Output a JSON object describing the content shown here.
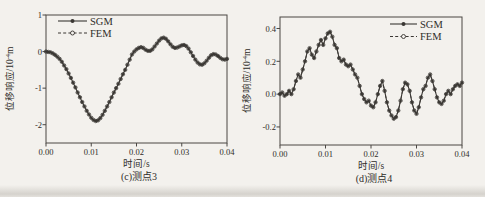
{
  "figure": {
    "background_color": "#f3f1ed",
    "curve_color": "#3a3733"
  },
  "chart_data": [
    {
      "type": "line",
      "caption": "(c)测点3",
      "xlabel": "时间/s",
      "ylabel_prefix": "位移响应/10",
      "ylabel_exp": "-4",
      "ylabel_unit": "m",
      "legend_position": "top-left",
      "grid": false,
      "color": "#3a3733",
      "xlim": [
        0,
        0.04
      ],
      "ylim": [
        -2.5,
        1.0
      ],
      "xticks": [
        0,
        0.01,
        0.02,
        0.03,
        0.04
      ],
      "xtick_labels": [
        "0.00",
        "0.01",
        "0.02",
        "0.03",
        "0.04"
      ],
      "yticks": [
        1,
        0,
        -1,
        -2
      ],
      "ytick_labels": [
        "1",
        "0",
        "-1",
        "-2"
      ],
      "x": [
        0,
        0.0005,
        0.001,
        0.0015,
        0.002,
        0.0025,
        0.003,
        0.0035,
        0.004,
        0.0045,
        0.005,
        0.0055,
        0.006,
        0.0065,
        0.007,
        0.0075,
        0.008,
        0.0085,
        0.009,
        0.0095,
        0.01,
        0.0105,
        0.011,
        0.0115,
        0.012,
        0.0125,
        0.013,
        0.0135,
        0.014,
        0.0145,
        0.015,
        0.0155,
        0.016,
        0.0165,
        0.017,
        0.0175,
        0.018,
        0.0185,
        0.019,
        0.0195,
        0.02,
        0.0205,
        0.021,
        0.0215,
        0.022,
        0.0225,
        0.023,
        0.0235,
        0.024,
        0.0245,
        0.025,
        0.0255,
        0.026,
        0.0265,
        0.027,
        0.0275,
        0.028,
        0.0285,
        0.029,
        0.0295,
        0.03,
        0.0305,
        0.031,
        0.0315,
        0.032,
        0.0325,
        0.033,
        0.0335,
        0.034,
        0.0345,
        0.035,
        0.0355,
        0.036,
        0.0365,
        0.037,
        0.0375,
        0.038,
        0.0385,
        0.039,
        0.0395,
        0.04
      ],
      "series": [
        {
          "name": "SGM",
          "line": "solid",
          "marker": "filled-circle",
          "y": [
            0,
            -0.01,
            -0.02,
            -0.05,
            -0.09,
            -0.14,
            -0.2,
            -0.28,
            -0.38,
            -0.48,
            -0.6,
            -0.72,
            -0.85,
            -0.98,
            -1.12,
            -1.25,
            -1.38,
            -1.5,
            -1.62,
            -1.72,
            -1.81,
            -1.87,
            -1.9,
            -1.88,
            -1.82,
            -1.73,
            -1.62,
            -1.5,
            -1.38,
            -1.25,
            -1.12,
            -1,
            -0.88,
            -0.75,
            -0.62,
            -0.5,
            -0.36,
            -0.22,
            -0.08,
            0,
            0.06,
            0.1,
            0.12,
            0.1,
            0.05,
            0.02,
            0.02,
            0.06,
            0.14,
            0.22,
            0.3,
            0.36,
            0.38,
            0.35,
            0.28,
            0.2,
            0.13,
            0.1,
            0.11,
            0.14,
            0.17,
            0.18,
            0.15,
            0.08,
            -0.02,
            -0.12,
            -0.22,
            -0.3,
            -0.35,
            -0.36,
            -0.32,
            -0.25,
            -0.17,
            -0.1,
            -0.07,
            -0.08,
            -0.12,
            -0.17,
            -0.21,
            -0.22,
            -0.2
          ]
        },
        {
          "name": "FEM",
          "line": "dashed",
          "marker": "open-circle",
          "y": [
            0,
            -0.01,
            -0.02,
            -0.05,
            -0.09,
            -0.14,
            -0.2,
            -0.28,
            -0.38,
            -0.48,
            -0.6,
            -0.72,
            -0.85,
            -0.98,
            -1.12,
            -1.25,
            -1.38,
            -1.5,
            -1.62,
            -1.72,
            -1.81,
            -1.87,
            -1.9,
            -1.88,
            -1.82,
            -1.73,
            -1.62,
            -1.5,
            -1.38,
            -1.25,
            -1.12,
            -1,
            -0.88,
            -0.75,
            -0.62,
            -0.5,
            -0.36,
            -0.22,
            -0.08,
            0,
            0.06,
            0.1,
            0.12,
            0.1,
            0.05,
            0.02,
            0.02,
            0.06,
            0.14,
            0.22,
            0.3,
            0.36,
            0.38,
            0.35,
            0.28,
            0.2,
            0.13,
            0.1,
            0.11,
            0.14,
            0.17,
            0.18,
            0.15,
            0.08,
            -0.02,
            -0.12,
            -0.22,
            -0.3,
            -0.35,
            -0.36,
            -0.32,
            -0.25,
            -0.17,
            -0.1,
            -0.07,
            -0.08,
            -0.12,
            -0.17,
            -0.21,
            -0.22,
            -0.2
          ]
        }
      ]
    },
    {
      "type": "line",
      "caption": "(d)测点4",
      "xlabel": "时间/s",
      "ylabel_prefix": "位移响应/10",
      "ylabel_exp": "-4",
      "ylabel_unit": "m",
      "legend_position": "top-right",
      "grid": false,
      "color": "#3a3733",
      "xlim": [
        0,
        0.04
      ],
      "ylim": [
        -0.31,
        0.47
      ],
      "xticks": [
        0,
        0.01,
        0.02,
        0.03,
        0.04
      ],
      "xtick_labels": [
        "0.00",
        "0.01",
        "0.02",
        "0.03",
        "0.04"
      ],
      "yticks": [
        0.4,
        0.2,
        0.0,
        -0.2
      ],
      "ytick_labels": [
        "0.4",
        "0.2",
        "0.0",
        "-0.2"
      ],
      "x": [
        0,
        0.0005,
        0.001,
        0.0015,
        0.002,
        0.0025,
        0.003,
        0.0035,
        0.004,
        0.0045,
        0.005,
        0.0055,
        0.006,
        0.0065,
        0.007,
        0.0075,
        0.008,
        0.0085,
        0.009,
        0.0095,
        0.01,
        0.0105,
        0.011,
        0.0115,
        0.012,
        0.0125,
        0.013,
        0.0135,
        0.014,
        0.0145,
        0.015,
        0.0155,
        0.016,
        0.0165,
        0.017,
        0.0175,
        0.018,
        0.0185,
        0.019,
        0.0195,
        0.02,
        0.0205,
        0.021,
        0.0215,
        0.022,
        0.0225,
        0.023,
        0.0235,
        0.024,
        0.0245,
        0.025,
        0.0255,
        0.026,
        0.0265,
        0.027,
        0.0275,
        0.028,
        0.0285,
        0.029,
        0.0295,
        0.03,
        0.0305,
        0.031,
        0.0315,
        0.032,
        0.0325,
        0.033,
        0.0335,
        0.034,
        0.0345,
        0.035,
        0.0355,
        0.036,
        0.0365,
        0.037,
        0.0375,
        0.038,
        0.0385,
        0.039,
        0.0395,
        0.04
      ],
      "series": [
        {
          "name": "SGM",
          "line": "solid",
          "marker": "filled-circle",
          "y": [
            0,
            0.01,
            -0.01,
            0,
            0.02,
            0,
            0.03,
            0.08,
            0.12,
            0.1,
            0.15,
            0.2,
            0.26,
            0.28,
            0.24,
            0.22,
            0.26,
            0.3,
            0.33,
            0.3,
            0.34,
            0.37,
            0.38,
            0.35,
            0.3,
            0.28,
            0.22,
            0.2,
            0.21,
            0.18,
            0.17,
            0.18,
            0.15,
            0.12,
            0.1,
            0.05,
            0,
            -0.03,
            -0.05,
            -0.04,
            -0.07,
            -0.08,
            -0.05,
            0,
            0.05,
            0.08,
            0.02,
            -0.05,
            -0.1,
            -0.13,
            -0.15,
            -0.14,
            -0.1,
            -0.04,
            0.03,
            0.07,
            0.06,
            0.02,
            -0.05,
            -0.1,
            -0.12,
            -0.08,
            -0.02,
            0.03,
            0.05,
            0.1,
            0.12,
            0.08,
            0.03,
            -0.02,
            -0.05,
            -0.06,
            -0.04,
            0,
            0.02,
            0,
            0.03,
            0.05,
            0.06,
            0.05,
            0.07
          ]
        },
        {
          "name": "FEM",
          "line": "dashed",
          "marker": "open-circle",
          "y": [
            0,
            0.01,
            -0.01,
            0,
            0.02,
            0,
            0.03,
            0.08,
            0.12,
            0.1,
            0.15,
            0.2,
            0.26,
            0.28,
            0.24,
            0.22,
            0.26,
            0.3,
            0.33,
            0.3,
            0.34,
            0.37,
            0.38,
            0.35,
            0.3,
            0.28,
            0.22,
            0.2,
            0.21,
            0.18,
            0.17,
            0.18,
            0.15,
            0.12,
            0.1,
            0.05,
            0,
            -0.03,
            -0.05,
            -0.04,
            -0.07,
            -0.08,
            -0.05,
            0,
            0.05,
            0.08,
            0.02,
            -0.05,
            -0.1,
            -0.13,
            -0.15,
            -0.14,
            -0.1,
            -0.04,
            0.03,
            0.07,
            0.06,
            0.02,
            -0.05,
            -0.1,
            -0.12,
            -0.08,
            -0.02,
            0.03,
            0.05,
            0.1,
            0.12,
            0.08,
            0.03,
            -0.02,
            -0.05,
            -0.06,
            -0.04,
            0,
            0.02,
            0,
            0.03,
            0.05,
            0.06,
            0.05,
            0.07
          ]
        }
      ]
    }
  ]
}
